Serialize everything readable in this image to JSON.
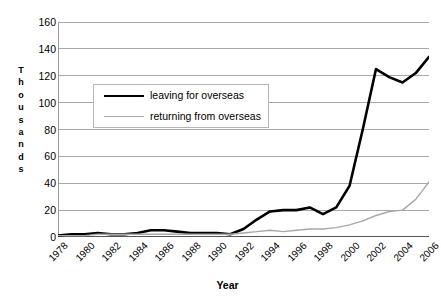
{
  "chart_data": {
    "type": "line",
    "title": "",
    "xlabel": "Year",
    "ylabel": "Thousands",
    "ylim": [
      0,
      160
    ],
    "xlim": [
      1978,
      2006
    ],
    "y_ticks": [
      0,
      20,
      40,
      60,
      80,
      100,
      120,
      140,
      160
    ],
    "x_ticks": [
      1978,
      1979,
      1980,
      1981,
      1982,
      1983,
      1984,
      1985,
      1986,
      1987,
      1988,
      1989,
      1990,
      1991,
      1992,
      1993,
      1994,
      1995,
      1996,
      1997,
      1998,
      1999,
      2000,
      2001,
      2002,
      2003,
      2004,
      2005,
      2006
    ],
    "x_tick_labels": [
      "1978",
      "1980",
      "1982",
      "1984",
      "1986",
      "1988",
      "1990",
      "1992",
      "1994",
      "1996",
      "1998",
      "2000",
      "2002",
      "2004",
      "2006"
    ],
    "x_tick_label_years": [
      1978,
      1980,
      1982,
      1984,
      1986,
      1988,
      1990,
      1992,
      1994,
      1996,
      1998,
      2000,
      2002,
      2004,
      2006
    ],
    "x_tick_label_rotation": -45,
    "grid": "horizontal",
    "grid_color": "#aaaaaa",
    "legend_position": "upper-left-inset",
    "x": [
      1978,
      1979,
      1980,
      1981,
      1982,
      1983,
      1984,
      1985,
      1986,
      1987,
      1988,
      1989,
      1990,
      1991,
      1992,
      1993,
      1994,
      1995,
      1996,
      1997,
      1998,
      1999,
      2000,
      2001,
      2002,
      2003,
      2004,
      2005,
      2006
    ],
    "series": [
      {
        "name": "leaving for overseas",
        "color": "#000000",
        "width": 2.6,
        "values": [
          1,
          2,
          2,
          3,
          2,
          2,
          3,
          5,
          5,
          4,
          3,
          3,
          3,
          2,
          6,
          13,
          19,
          20,
          20,
          22,
          17,
          22,
          38,
          80,
          125,
          119,
          115,
          122,
          134
        ]
      },
      {
        "name": "returning from overseas",
        "color": "#a8a8a8",
        "width": 1.4,
        "values": [
          1,
          1,
          1,
          2,
          2,
          2,
          2,
          2,
          2,
          2,
          2,
          2,
          2,
          2,
          3,
          4,
          5,
          4,
          5,
          6,
          6,
          7,
          9,
          12,
          16,
          19,
          20,
          28,
          41
        ]
      }
    ]
  },
  "axes": {
    "y_title_letters": [
      "T",
      "h",
      "o",
      "u",
      "s",
      "a",
      "n",
      "d",
      "s"
    ],
    "x_title": "Year"
  },
  "legend": {
    "items": [
      {
        "label": "leaving for overseas",
        "style": "thick"
      },
      {
        "label": "returning from overseas",
        "style": "thin"
      }
    ]
  }
}
